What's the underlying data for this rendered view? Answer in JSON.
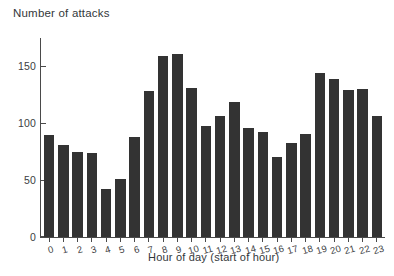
{
  "chart_data": {
    "type": "bar",
    "title": "",
    "xlabel": "Hour of day (start of hour)",
    "ylabel": "Number of attacks",
    "categories": [
      "0",
      "1",
      "2",
      "3",
      "4",
      "5",
      "6",
      "7",
      "8",
      "9",
      "10",
      "11",
      "12",
      "13",
      "14",
      "15",
      "16",
      "17",
      "18",
      "19",
      "20",
      "21",
      "22",
      "23"
    ],
    "values": [
      90,
      81,
      75,
      74,
      42,
      51,
      88,
      128,
      159,
      161,
      131,
      98,
      106,
      119,
      96,
      92,
      70,
      83,
      91,
      144,
      139,
      129,
      130,
      106
    ],
    "yticks": [
      0,
      50,
      100,
      150
    ],
    "ytick_labels": [
      "0",
      "50",
      "100",
      "150"
    ],
    "ylim": [
      0,
      175
    ],
    "grid": false,
    "legend": false,
    "bar_color": "#333333",
    "axis_color": "#4a4a4a",
    "background": "#ffffff"
  }
}
